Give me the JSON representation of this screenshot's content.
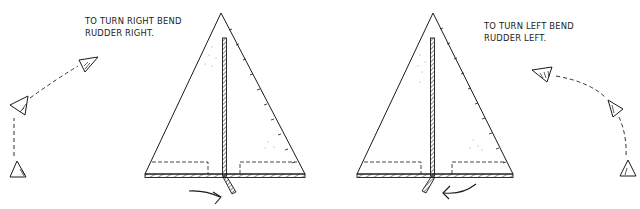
{
  "figure": {
    "left_panel": {
      "caption_lines": [
        "To turn right bend",
        "rudder right."
      ],
      "rudder_direction": "right",
      "turn_direction": "right",
      "flight_path_icon": "curved-dashed-path-right-turn"
    },
    "right_panel": {
      "caption_lines": [
        "To turn left bend",
        "rudder left."
      ],
      "rudder_direction": "left",
      "turn_direction": "left",
      "flight_path_icon": "curved-dashed-path-left-turn"
    },
    "colors": {
      "ink": "#1a1a1a",
      "background": "#ffffff"
    }
  }
}
